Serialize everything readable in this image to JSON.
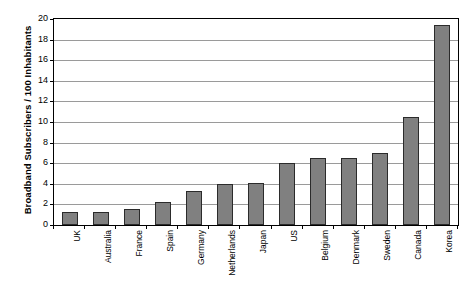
{
  "chart_data": {
    "type": "bar",
    "title": "",
    "xlabel": "",
    "ylabel": "Broadband Subscribers / 100 Inhabitants",
    "ylim": [
      0,
      20
    ],
    "ytick_step": 2,
    "yticks": [
      20,
      18,
      16,
      14,
      12,
      10,
      8,
      6,
      4,
      2,
      0
    ],
    "grid": true,
    "legend": "none",
    "categories": [
      "UK",
      "Australia",
      "France",
      "Spain",
      "Germany",
      "Netherlands",
      "Japan",
      "US",
      "Belgium",
      "Denmark",
      "Sweden",
      "Canada",
      "Korea"
    ],
    "values": [
      1.3,
      1.3,
      1.6,
      2.2,
      3.3,
      4.0,
      4.1,
      6.0,
      6.5,
      6.5,
      7.0,
      10.5,
      19.4
    ],
    "series": [
      {
        "name": "Broadband Subscribers per 100 Inhabitants",
        "values": [
          1.3,
          1.3,
          1.6,
          2.2,
          3.3,
          4.0,
          4.1,
          6.0,
          6.5,
          6.5,
          7.0,
          10.5,
          19.4
        ]
      }
    ],
    "bar_color": "#808080",
    "bar_border_color": "#2b2b2b",
    "gridline_color": "#9a9a9a",
    "axis_color": "#000000",
    "background_color": "#ffffff"
  }
}
